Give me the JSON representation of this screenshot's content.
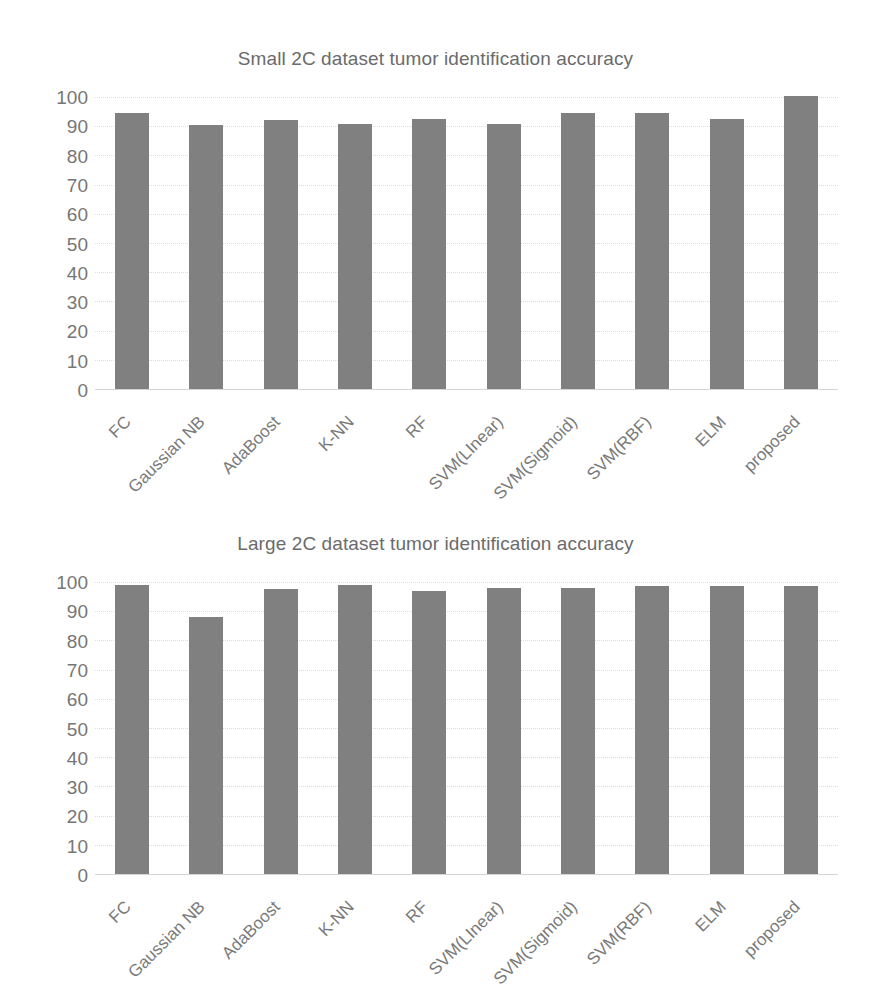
{
  "chart_data": [
    {
      "type": "bar",
      "title": "Small 2C dataset tumor identification accuracy",
      "xlabel": "",
      "ylabel": "",
      "ylim": [
        0,
        100
      ],
      "yticks": [
        100,
        90,
        80,
        70,
        60,
        50,
        40,
        30,
        20,
        10,
        0
      ],
      "grid": true,
      "legend": null,
      "bar_color": "#808080",
      "categories": [
        "FC",
        "Gaussian NB",
        "AdaBoost",
        "K-NN",
        "RF",
        "SVM(LInear)",
        "SVM(Sigmoid)",
        "SVM(RBF)",
        "ELM",
        "proposed"
      ],
      "values": [
        94.5,
        90.5,
        92.2,
        90.6,
        92.4,
        90.6,
        94.6,
        94.6,
        92.4,
        100.4
      ]
    },
    {
      "type": "bar",
      "title": "Large 2C dataset tumor identification accuracy",
      "xlabel": "",
      "ylabel": "",
      "ylim": [
        0,
        100
      ],
      "yticks": [
        100,
        90,
        80,
        70,
        60,
        50,
        40,
        30,
        20,
        10,
        0
      ],
      "grid": true,
      "legend": null,
      "bar_color": "#808080",
      "categories": [
        "FC",
        "Gaussian NB",
        "AdaBoost",
        "K-NN",
        "RF",
        "SVM(LInear)",
        "SVM(Sigmoid)",
        "SVM(RBF)",
        "ELM",
        "proposed"
      ],
      "values": [
        99.0,
        88.0,
        97.5,
        99.0,
        97.0,
        97.8,
        98.0,
        98.5,
        98.8,
        98.6
      ]
    }
  ]
}
